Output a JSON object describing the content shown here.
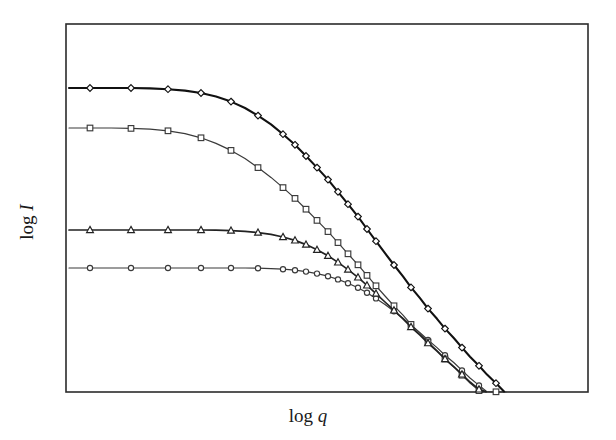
{
  "figure": {
    "background_color": "#ffffff",
    "frame_color": "#2b2b2b",
    "xlabel_prefix": "log",
    "xlabel_symbol": "q",
    "ylabel_prefix": "log",
    "ylabel_symbol": "I"
  },
  "chart_data": {
    "type": "line",
    "title": "",
    "xlabel": "log q",
    "ylabel": "log I",
    "grid": false,
    "legend": "none",
    "axis_ticks": "none",
    "tick_labels": "none",
    "xlim": [
      0,
      1
    ],
    "ylim": [
      0,
      1
    ],
    "plot_box_px": {
      "left": 66,
      "top": 24,
      "right": 588,
      "bottom": 392
    },
    "series": [
      {
        "name": "curve-1",
        "marker": "diamond",
        "line_color": "#111111",
        "line_width": 2.1,
        "marker_size": 5.4,
        "plateau_y_px": 88,
        "knee_x_px": 196,
        "points_px": [
          [
            69,
            88
          ],
          [
            90,
            88
          ],
          [
            111,
            88
          ],
          [
            131,
            88
          ],
          [
            150,
            88.4
          ],
          [
            168,
            89.2
          ],
          [
            185,
            90.6
          ],
          [
            201,
            93.0
          ],
          [
            216,
            96.6
          ],
          [
            231,
            101.6
          ],
          [
            245,
            108.0
          ],
          [
            258,
            115.6
          ],
          [
            271,
            124.4
          ],
          [
            283,
            134.2
          ],
          [
            295,
            144.8
          ],
          [
            306,
            156.0
          ],
          [
            317,
            167.6
          ],
          [
            328,
            179.6
          ],
          [
            338,
            191.8
          ],
          [
            348,
            204.2
          ],
          [
            358,
            216.6
          ],
          [
            367,
            229.0
          ],
          [
            376,
            241.2
          ],
          [
            385,
            253.2
          ],
          [
            394,
            265.0
          ],
          [
            403,
            276.4
          ],
          [
            411,
            287.4
          ],
          [
            420,
            298.2
          ],
          [
            428,
            308.6
          ],
          [
            437,
            318.8
          ],
          [
            445,
            328.6
          ],
          [
            454,
            338.2
          ],
          [
            462,
            347.6
          ],
          [
            470,
            356.8
          ],
          [
            479,
            365.8
          ],
          [
            487,
            374.6
          ],
          [
            496,
            383.2
          ],
          [
            504,
            391.4
          ]
        ]
      },
      {
        "name": "curve-2",
        "marker": "square",
        "line_color": "#3a3a3a",
        "line_width": 1.2,
        "marker_size": 5.6,
        "plateau_y_px": 128,
        "knee_x_px": 185,
        "points_px": [
          [
            69,
            128
          ],
          [
            90,
            128
          ],
          [
            111,
            128
          ],
          [
            131,
            128.4
          ],
          [
            150,
            129.2
          ],
          [
            168,
            130.8
          ],
          [
            185,
            133.6
          ],
          [
            201,
            137.8
          ],
          [
            216,
            143.4
          ],
          [
            231,
            150.4
          ],
          [
            245,
            158.6
          ],
          [
            258,
            167.6
          ],
          [
            271,
            177.4
          ],
          [
            283,
            187.6
          ],
          [
            295,
            198.4
          ],
          [
            306,
            209.2
          ],
          [
            317,
            220.4
          ],
          [
            328,
            231.6
          ],
          [
            338,
            242.6
          ],
          [
            348,
            253.8
          ],
          [
            358,
            264.8
          ],
          [
            367,
            275.4
          ],
          [
            376,
            285.8
          ],
          [
            385,
            296.0
          ],
          [
            394,
            305.8
          ],
          [
            403,
            315.2
          ],
          [
            411,
            324.4
          ],
          [
            420,
            333.4
          ],
          [
            428,
            342.0
          ],
          [
            437,
            350.6
          ],
          [
            445,
            359.0
          ],
          [
            454,
            367.2
          ],
          [
            462,
            375.2
          ],
          [
            470,
            383.0
          ],
          [
            479,
            390.6
          ],
          [
            487,
            391.6
          ],
          [
            496,
            391.8
          ],
          [
            506,
            392.0
          ]
        ]
      },
      {
        "name": "curve-3",
        "marker": "triangle",
        "line_color": "#222222",
        "line_width": 1.7,
        "marker_size": 6.0,
        "plateau_y_px": 230,
        "knee_x_px": 290,
        "points_px": [
          [
            69,
            230
          ],
          [
            90,
            230
          ],
          [
            111,
            230
          ],
          [
            131,
            230
          ],
          [
            150,
            230
          ],
          [
            168,
            230
          ],
          [
            185,
            230
          ],
          [
            201,
            230
          ],
          [
            216,
            230.2
          ],
          [
            231,
            230.6
          ],
          [
            245,
            231.4
          ],
          [
            258,
            232.6
          ],
          [
            271,
            234.4
          ],
          [
            283,
            237.0
          ],
          [
            295,
            240.4
          ],
          [
            306,
            244.6
          ],
          [
            317,
            249.8
          ],
          [
            328,
            255.8
          ],
          [
            338,
            262.4
          ],
          [
            348,
            269.6
          ],
          [
            358,
            277.4
          ],
          [
            367,
            285.4
          ],
          [
            376,
            293.6
          ],
          [
            385,
            302.0
          ],
          [
            394,
            310.4
          ],
          [
            403,
            318.8
          ],
          [
            411,
            327.0
          ],
          [
            420,
            335.2
          ],
          [
            428,
            343.2
          ],
          [
            437,
            351.2
          ],
          [
            445,
            359.0
          ],
          [
            454,
            366.8
          ],
          [
            462,
            374.4
          ],
          [
            470,
            382.0
          ],
          [
            479,
            389.4
          ],
          [
            486,
            391.8
          ]
        ]
      },
      {
        "name": "curve-4",
        "marker": "circle",
        "line_color": "#3a3a3a",
        "line_width": 1.2,
        "marker_size": 5.2,
        "plateau_y_px": 268,
        "knee_x_px": 330,
        "points_px": [
          [
            69,
            268
          ],
          [
            90,
            268
          ],
          [
            111,
            268
          ],
          [
            131,
            268
          ],
          [
            150,
            268
          ],
          [
            168,
            268
          ],
          [
            185,
            268
          ],
          [
            201,
            268
          ],
          [
            216,
            268
          ],
          [
            231,
            268
          ],
          [
            245,
            268
          ],
          [
            258,
            268.2
          ],
          [
            271,
            268.6
          ],
          [
            283,
            269.2
          ],
          [
            295,
            270.2
          ],
          [
            306,
            271.6
          ],
          [
            317,
            273.6
          ],
          [
            328,
            276.2
          ],
          [
            338,
            279.4
          ],
          [
            348,
            283.2
          ],
          [
            358,
            287.8
          ],
          [
            367,
            292.8
          ],
          [
            376,
            298.4
          ],
          [
            385,
            304.6
          ],
          [
            394,
            311.2
          ],
          [
            403,
            318.2
          ],
          [
            411,
            325.2
          ],
          [
            420,
            332.6
          ],
          [
            428,
            340.0
          ],
          [
            437,
            347.6
          ],
          [
            445,
            355.2
          ],
          [
            454,
            362.8
          ],
          [
            462,
            370.4
          ],
          [
            470,
            378.0
          ],
          [
            479,
            385.4
          ],
          [
            486,
            391.0
          ]
        ]
      }
    ]
  }
}
